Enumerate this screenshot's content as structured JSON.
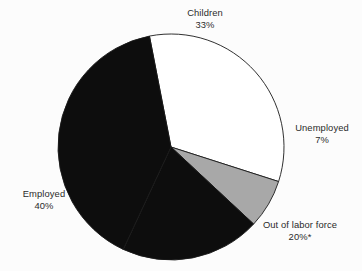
{
  "chart_data": {
    "type": "pie",
    "title": "",
    "subtitle": "",
    "xlabel": "",
    "ylabel": "",
    "legend_position": "outside-labels",
    "grid": false,
    "total_percent": 100,
    "categories": [
      "Children",
      "Unemployed",
      "Out of labor force",
      "Employed"
    ],
    "values": [
      33,
      7,
      20,
      40
    ],
    "slices": [
      {
        "label": "Children",
        "value": 33,
        "value_text": "33%",
        "color": "#ffffff",
        "stroke": "#1a1a1a",
        "label_x": 205,
        "label_y": 16,
        "label_anchor": "middle"
      },
      {
        "label": "Unemployed",
        "value": 7,
        "value_text": "7%",
        "color": "#a8a8a8",
        "stroke": "#1a1a1a",
        "label_x": 322,
        "label_y": 131,
        "label_anchor": "middle"
      },
      {
        "label": "Out of labor force",
        "value": 20,
        "value_text": "20%*",
        "color": "#0d0d0d",
        "stroke": "#1a1a1a",
        "label_x": 300,
        "label_y": 228,
        "label_anchor": "middle"
      },
      {
        "label": "Employed",
        "value": 40,
        "value_text": "40%",
        "color": "#0d0d0d",
        "stroke": "#1a1a1a",
        "label_x": 44,
        "label_y": 197,
        "label_anchor": "middle"
      }
    ],
    "geometry": {
      "center_x": 171,
      "center_y": 147,
      "radius": 113,
      "start_angle_deg": -11
    },
    "footnote_marker": "*"
  }
}
